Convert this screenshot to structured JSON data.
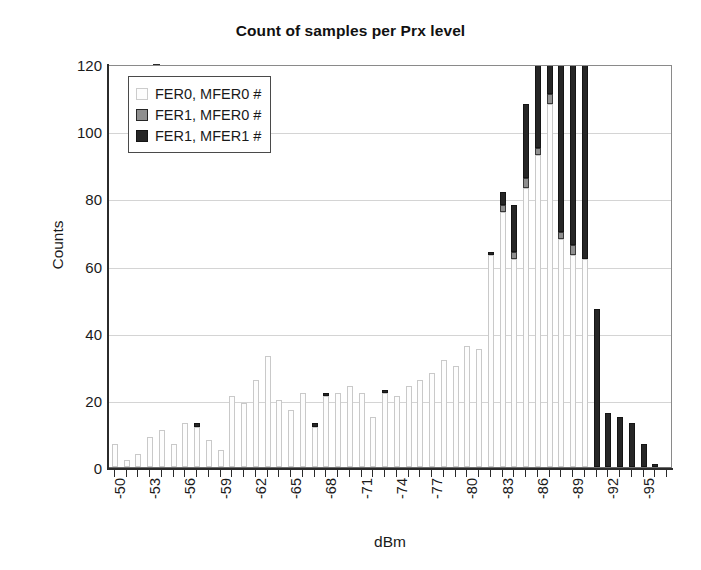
{
  "chart_data": {
    "type": "bar",
    "subtype": "stacked-histogram",
    "title": "Count of samples per Prx level",
    "xlabel": "dBm",
    "ylabel": "Counts",
    "ylim": [
      0,
      120
    ],
    "ytick_step": 20,
    "yticks": [
      0,
      20,
      40,
      60,
      80,
      100,
      120
    ],
    "grid": "horizontal",
    "legend_position": "top-left-inside",
    "xtick_label_every": 3,
    "xtick_rotation": -90,
    "categories": [
      "-50",
      "-51",
      "-52",
      "-53",
      "-54",
      "-55",
      "-56",
      "-57",
      "-58",
      "-59",
      "-60",
      "-61",
      "-62",
      "-63",
      "-64",
      "-65",
      "-66",
      "-67",
      "-68",
      "-69",
      "-70",
      "-71",
      "-72",
      "-73",
      "-74",
      "-75",
      "-76",
      "-77",
      "-78",
      "-79",
      "-80",
      "-81",
      "-82",
      "-83",
      "-84",
      "-85",
      "-86",
      "-87",
      "-88",
      "-89",
      "-90",
      "-91",
      "-92",
      "-93",
      "-94",
      "-95",
      "-96",
      "-97"
    ],
    "xtick_labels": [
      "-50",
      "",
      "",
      "-53",
      "",
      "",
      "-56",
      "",
      "",
      "-59",
      "",
      "",
      "-62",
      "",
      "",
      "-65",
      "",
      "",
      "-68",
      "",
      "",
      "-71",
      "",
      "",
      "-74",
      "",
      "",
      "-77",
      "",
      "",
      "-80",
      "",
      "",
      "-83",
      "",
      "",
      "-86",
      "",
      "",
      "-89",
      "",
      "",
      "-92",
      "",
      "",
      "-95",
      "",
      ""
    ],
    "series": [
      {
        "name": "FER0, MFER0 #",
        "color": "#fdfdfd",
        "edge": "#c9c9c9",
        "values": [
          7,
          2,
          4,
          9,
          11,
          7,
          13,
          12,
          8,
          5,
          21,
          19,
          26,
          33,
          20,
          17,
          22,
          12,
          21,
          22,
          24,
          22,
          15,
          22,
          21,
          24,
          26,
          28,
          32,
          30,
          36,
          35,
          63,
          76,
          62,
          83,
          93,
          108,
          68,
          63,
          62,
          0,
          0,
          0,
          0,
          0,
          0,
          0
        ]
      },
      {
        "name": "FER1, MFER0 #",
        "color": "#8f8f8f",
        "edge": "#262626",
        "values": [
          0,
          0,
          0,
          0,
          0,
          0,
          0,
          0,
          0,
          0,
          0,
          0,
          0,
          0,
          0,
          0,
          0,
          0,
          0,
          0,
          0,
          0,
          0,
          0,
          0,
          0,
          0,
          0,
          0,
          0,
          0,
          0,
          0,
          2,
          2,
          3,
          2,
          3,
          2,
          3,
          0,
          0,
          0,
          0,
          0,
          0,
          0,
          0
        ]
      },
      {
        "name": "FER1, MFER1 #",
        "color": "#262626",
        "edge": "#151515",
        "values": [
          0,
          0,
          0,
          0,
          0,
          0,
          0,
          1,
          0,
          0,
          0,
          0,
          0,
          0,
          0,
          0,
          0,
          1,
          1,
          0,
          0,
          0,
          0,
          1,
          0,
          0,
          0,
          0,
          0,
          0,
          0,
          0,
          1,
          4,
          14,
          22,
          38,
          53,
          73,
          55,
          59,
          47,
          16,
          15,
          13,
          7,
          1,
          0
        ]
      }
    ]
  },
  "legend": {
    "items": [
      {
        "label": "FER0, MFER0 #",
        "swatch": "s0"
      },
      {
        "label": "FER1, MFER0 #",
        "swatch": "s1"
      },
      {
        "label": "FER1, MFER1 #",
        "swatch": "s2"
      }
    ]
  }
}
